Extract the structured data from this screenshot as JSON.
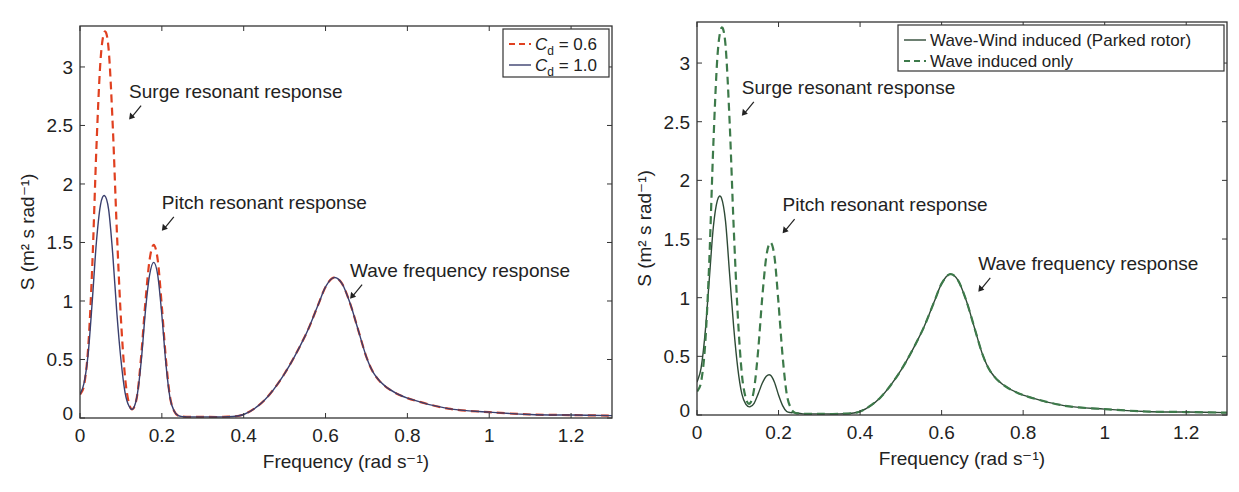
{
  "chart_data": [
    {
      "type": "line",
      "title": "",
      "xlabel": "Frequency (rad s⁻¹)",
      "ylabel": "S (m² s rad⁻¹)",
      "xlim": [
        0,
        1.3
      ],
      "ylim": [
        0,
        3.35
      ],
      "xticks": [
        0,
        0.2,
        0.4,
        0.6,
        0.8,
        1,
        1.2
      ],
      "xtick_labels": [
        "0",
        "0.2",
        "0.4",
        "0.6",
        "0.8",
        "1",
        "1.2"
      ],
      "yticks": [
        0,
        0.5,
        1,
        1.5,
        2,
        2.5,
        3
      ],
      "ytick_labels": [
        "0",
        "0.5",
        "1",
        "1.5",
        "2",
        "2.5",
        "3"
      ],
      "grid": false,
      "legend_position": "upper right",
      "series": [
        {
          "name": "C_d = 0.6",
          "legend_main": "C",
          "legend_sub": "d",
          "legend_rest": " = 0.6",
          "style": "dashed",
          "color": "#e04020",
          "x": [
            0,
            0.01,
            0.02,
            0.03,
            0.04,
            0.05,
            0.06,
            0.07,
            0.08,
            0.09,
            0.1,
            0.11,
            0.12,
            0.13,
            0.14,
            0.15,
            0.16,
            0.17,
            0.18,
            0.19,
            0.2,
            0.21,
            0.22,
            0.23,
            0.24,
            0.26,
            0.3,
            0.35,
            0.4,
            0.45,
            0.5,
            0.55,
            0.58,
            0.6,
            0.62,
            0.64,
            0.66,
            0.68,
            0.7,
            0.72,
            0.75,
            0.8,
            0.9,
            1.0,
            1.1,
            1.2,
            1.3
          ],
          "y": [
            0.2,
            0.28,
            0.6,
            1.3,
            2.3,
            3.05,
            3.3,
            3.15,
            2.5,
            1.6,
            0.85,
            0.35,
            0.12,
            0.08,
            0.2,
            0.55,
            1.0,
            1.35,
            1.48,
            1.35,
            0.95,
            0.5,
            0.18,
            0.06,
            0.02,
            0.01,
            0.01,
            0.01,
            0.03,
            0.15,
            0.38,
            0.7,
            0.95,
            1.12,
            1.2,
            1.15,
            0.98,
            0.75,
            0.52,
            0.37,
            0.26,
            0.17,
            0.08,
            0.05,
            0.03,
            0.025,
            0.02
          ]
        },
        {
          "name": "C_d = 1.0",
          "legend_main": "C",
          "legend_sub": "d",
          "legend_rest": " = 1.0",
          "style": "solid",
          "color": "#3a3f6e",
          "x": [
            0,
            0.01,
            0.02,
            0.03,
            0.04,
            0.05,
            0.06,
            0.07,
            0.08,
            0.09,
            0.1,
            0.11,
            0.12,
            0.13,
            0.14,
            0.15,
            0.16,
            0.17,
            0.18,
            0.19,
            0.2,
            0.21,
            0.22,
            0.23,
            0.24,
            0.26,
            0.3,
            0.35,
            0.4,
            0.45,
            0.5,
            0.55,
            0.58,
            0.6,
            0.62,
            0.64,
            0.66,
            0.68,
            0.7,
            0.72,
            0.75,
            0.8,
            0.9,
            1.0,
            1.1,
            1.2,
            1.3
          ],
          "y": [
            0.2,
            0.3,
            0.55,
            1.0,
            1.5,
            1.82,
            1.9,
            1.78,
            1.4,
            0.9,
            0.5,
            0.22,
            0.1,
            0.08,
            0.2,
            0.5,
            0.92,
            1.22,
            1.33,
            1.22,
            0.88,
            0.46,
            0.17,
            0.06,
            0.02,
            0.01,
            0.01,
            0.01,
            0.03,
            0.15,
            0.38,
            0.7,
            0.95,
            1.12,
            1.2,
            1.15,
            0.98,
            0.75,
            0.52,
            0.37,
            0.26,
            0.17,
            0.08,
            0.05,
            0.03,
            0.025,
            0.02
          ]
        }
      ],
      "annotations": [
        {
          "text": "Surge resonant response",
          "x": 0.12,
          "y": 2.55
        },
        {
          "text": "Pitch resonant response",
          "x": 0.2,
          "y": 1.6
        },
        {
          "text": "Wave frequency response",
          "x": 0.66,
          "y": 1.02
        }
      ]
    },
    {
      "type": "line",
      "title": "",
      "xlabel": "Frequency (rad s⁻¹)",
      "ylabel": "S (m² s rad⁻¹)",
      "xlim": [
        0,
        1.3
      ],
      "ylim": [
        0,
        3.35
      ],
      "xticks": [
        0,
        0.2,
        0.4,
        0.6,
        0.8,
        1,
        1.2
      ],
      "xtick_labels": [
        "0",
        "0.2",
        "0.4",
        "0.6",
        "0.8",
        "1",
        "1.2"
      ],
      "yticks": [
        0,
        0.5,
        1,
        1.5,
        2,
        2.5,
        3
      ],
      "ytick_labels": [
        "0",
        "0.5",
        "1",
        "1.5",
        "2",
        "2.5",
        "3"
      ],
      "grid": false,
      "legend_position": "upper right",
      "series": [
        {
          "name": "Wave-Wind induced (Parked rotor)",
          "style": "solid",
          "color": "#2e4a36",
          "x": [
            0,
            0.01,
            0.02,
            0.03,
            0.04,
            0.05,
            0.06,
            0.07,
            0.08,
            0.09,
            0.1,
            0.11,
            0.12,
            0.13,
            0.14,
            0.15,
            0.16,
            0.17,
            0.18,
            0.19,
            0.2,
            0.21,
            0.22,
            0.23,
            0.24,
            0.26,
            0.3,
            0.35,
            0.4,
            0.45,
            0.5,
            0.55,
            0.58,
            0.6,
            0.62,
            0.64,
            0.66,
            0.68,
            0.7,
            0.72,
            0.75,
            0.8,
            0.9,
            1.0,
            1.1,
            1.2,
            1.3
          ],
          "y": [
            0.28,
            0.4,
            0.7,
            1.15,
            1.6,
            1.83,
            1.85,
            1.65,
            1.2,
            0.75,
            0.4,
            0.18,
            0.09,
            0.07,
            0.1,
            0.18,
            0.27,
            0.33,
            0.34,
            0.28,
            0.17,
            0.08,
            0.03,
            0.02,
            0.02,
            0.01,
            0.01,
            0.01,
            0.03,
            0.15,
            0.38,
            0.7,
            0.95,
            1.12,
            1.2,
            1.15,
            0.98,
            0.75,
            0.52,
            0.37,
            0.26,
            0.17,
            0.08,
            0.05,
            0.03,
            0.025,
            0.02
          ]
        },
        {
          "name": "Wave induced only",
          "style": "dashed",
          "color": "#3d7a4a",
          "x": [
            0,
            0.01,
            0.02,
            0.03,
            0.04,
            0.05,
            0.06,
            0.07,
            0.08,
            0.09,
            0.1,
            0.11,
            0.12,
            0.13,
            0.14,
            0.15,
            0.16,
            0.17,
            0.18,
            0.19,
            0.2,
            0.21,
            0.22,
            0.23,
            0.24,
            0.26,
            0.3,
            0.35,
            0.4,
            0.45,
            0.5,
            0.55,
            0.58,
            0.6,
            0.62,
            0.64,
            0.66,
            0.68,
            0.7,
            0.72,
            0.75,
            0.8,
            0.9,
            1.0,
            1.1,
            1.2,
            1.3
          ],
          "y": [
            0.2,
            0.28,
            0.6,
            1.3,
            2.3,
            3.05,
            3.3,
            3.15,
            2.5,
            1.6,
            0.85,
            0.35,
            0.14,
            0.1,
            0.22,
            0.55,
            1.0,
            1.35,
            1.47,
            1.35,
            0.95,
            0.5,
            0.18,
            0.06,
            0.02,
            0.01,
            0.01,
            0.01,
            0.03,
            0.15,
            0.38,
            0.7,
            0.95,
            1.12,
            1.2,
            1.15,
            0.98,
            0.75,
            0.52,
            0.37,
            0.26,
            0.17,
            0.08,
            0.05,
            0.03,
            0.025,
            0.02
          ]
        }
      ],
      "annotations": [
        {
          "text": "Surge resonant response",
          "x": 0.11,
          "y": 2.55
        },
        {
          "text": "Pitch resonant response",
          "x": 0.21,
          "y": 1.55
        },
        {
          "text": "Wave frequency response",
          "x": 0.69,
          "y": 1.05
        }
      ]
    }
  ],
  "layout": {
    "panels": [
      {
        "left": 80,
        "right": 612,
        "top": 26,
        "bottom": 418
      },
      {
        "left": 697,
        "right": 1227,
        "top": 22,
        "bottom": 415
      }
    ]
  }
}
